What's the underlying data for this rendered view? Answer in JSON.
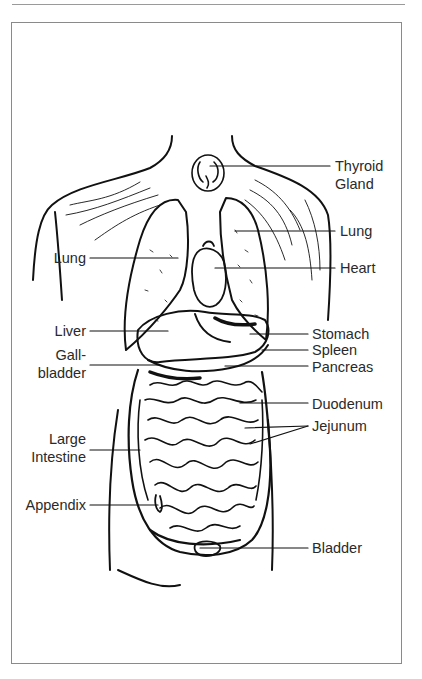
{
  "figure": {
    "labels_right": [
      {
        "id": "thyroid",
        "line1": "Thyroid",
        "line2": "Gland"
      },
      {
        "id": "lung-right",
        "line1": "Lung"
      },
      {
        "id": "heart",
        "line1": "Heart"
      },
      {
        "id": "stomach",
        "line1": "Stomach"
      },
      {
        "id": "spleen",
        "line1": "Spleen"
      },
      {
        "id": "pancreas",
        "line1": "Pancreas"
      },
      {
        "id": "duodenum",
        "line1": "Duodenum"
      },
      {
        "id": "jejunum",
        "line1": "Jejunum"
      },
      {
        "id": "bladder",
        "line1": "Bladder"
      }
    ],
    "labels_left": [
      {
        "id": "lung-left",
        "line1": "Lung"
      },
      {
        "id": "liver",
        "line1": "Liver"
      },
      {
        "id": "gallbladder",
        "line1": "Gall-",
        "line2": "bladder"
      },
      {
        "id": "large-intestine",
        "line1": "Large",
        "line2": "Intestine"
      },
      {
        "id": "appendix",
        "line1": "Appendix"
      }
    ]
  },
  "colors": {
    "ink": "#111111",
    "label_text": "#2a2a2a",
    "frame": "#8a8a8a",
    "background": "#ffffff"
  }
}
